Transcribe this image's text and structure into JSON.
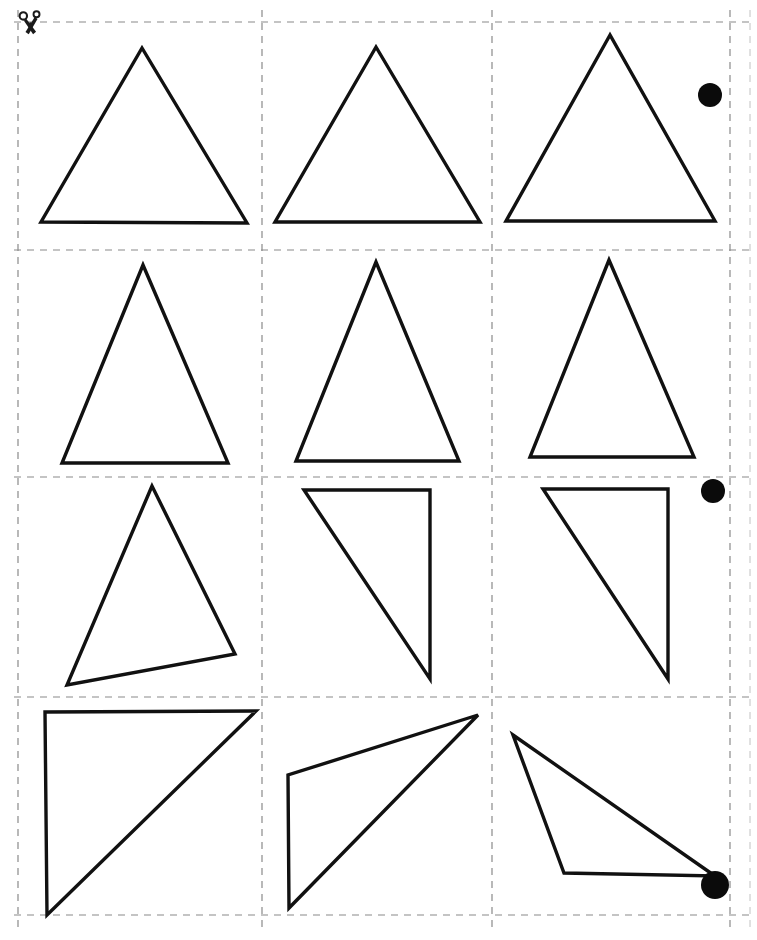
{
  "page": {
    "width": 757,
    "height": 940,
    "background_color": "#ffffff",
    "ink_color": "#111111",
    "cut_line_color": "#8a8a8a",
    "marker_color": "#0b0b0b"
  },
  "cut_guide": {
    "name": "dashed-cut-grid",
    "columns": 3,
    "rows": 4,
    "vertical_lines_x": [
      18,
      262,
      492,
      730,
      750
    ],
    "horizontal_lines_y": [
      22,
      250,
      477,
      697,
      915
    ],
    "dash_pattern": "7 6",
    "stroke_width": 1.2
  },
  "scissors": {
    "label": "cut-here-scissors",
    "x": 22,
    "y": 12
  },
  "markers": [
    {
      "label": "corner-dot-row1",
      "cx": 710,
      "cy": 95,
      "r": 12
    },
    {
      "label": "corner-dot-row3",
      "cx": 713,
      "cy": 491,
      "r": 12
    },
    {
      "label": "corner-dot-row4",
      "cx": 715,
      "cy": 885,
      "r": 14
    }
  ],
  "cells": [
    {
      "id": 1,
      "row": 1,
      "column": 1,
      "shape": "equilateral-triangle-upright",
      "orientation": "0deg",
      "bounds": {
        "x": 18,
        "y": 22,
        "w": 244,
        "h": 228
      },
      "points": "142,48 41,222 247,223",
      "has_marker": false
    },
    {
      "id": 2,
      "row": 1,
      "column": 2,
      "shape": "equilateral-triangle-upright",
      "orientation": "0deg",
      "bounds": {
        "x": 262,
        "y": 22,
        "w": 230,
        "h": 228
      },
      "points": "376,47 275,222 480,222",
      "has_marker": false
    },
    {
      "id": 3,
      "row": 1,
      "column": 3,
      "shape": "equilateral-triangle-upright",
      "orientation": "0deg",
      "bounds": {
        "x": 492,
        "y": 22,
        "w": 238,
        "h": 228
      },
      "points": "610,35 506,221 715,221",
      "has_marker": true
    },
    {
      "id": 4,
      "row": 2,
      "column": 1,
      "shape": "isosceles-triangle-tall",
      "orientation": "0deg",
      "bounds": {
        "x": 18,
        "y": 250,
        "w": 244,
        "h": 227
      },
      "points": "143,265 62,463 228,463",
      "has_marker": false
    },
    {
      "id": 5,
      "row": 2,
      "column": 2,
      "shape": "isosceles-triangle-tall",
      "orientation": "0deg",
      "bounds": {
        "x": 262,
        "y": 250,
        "w": 230,
        "h": 227
      },
      "points": "376,262 296,461 459,461",
      "has_marker": false
    },
    {
      "id": 6,
      "row": 2,
      "column": 3,
      "shape": "isosceles-triangle-tall",
      "orientation": "0deg",
      "bounds": {
        "x": 492,
        "y": 250,
        "w": 238,
        "h": 227
      },
      "points": "609,260 530,457 694,457",
      "has_marker": false
    },
    {
      "id": 7,
      "row": 3,
      "column": 1,
      "shape": "scalene-triangle-tilted",
      "orientation": "-10deg",
      "bounds": {
        "x": 18,
        "y": 477,
        "w": 244,
        "h": 220
      },
      "points": "152,486 67,685 235,654",
      "has_marker": false
    },
    {
      "id": 8,
      "row": 3,
      "column": 2,
      "shape": "right-triangle-rotated",
      "orientation": "90deg",
      "bounds": {
        "x": 262,
        "y": 477,
        "w": 230,
        "h": 220
      },
      "points": "304,490 430,490 430,679",
      "has_marker": false
    },
    {
      "id": 9,
      "row": 3,
      "column": 3,
      "shape": "right-triangle-rotated",
      "orientation": "90deg",
      "bounds": {
        "x": 492,
        "y": 477,
        "w": 238,
        "h": 220
      },
      "points": "543,489 668,489 668,679",
      "has_marker": true
    },
    {
      "id": 10,
      "row": 4,
      "column": 1,
      "shape": "right-triangle-isosceles",
      "orientation": "0deg",
      "bounds": {
        "x": 18,
        "y": 697,
        "w": 244,
        "h": 218
      },
      "points": "45,712 256,711 47,915",
      "has_marker": false
    },
    {
      "id": 11,
      "row": 4,
      "column": 2,
      "shape": "scalene-triangle-obtuse",
      "orientation": "-35deg",
      "bounds": {
        "x": 262,
        "y": 697,
        "w": 230,
        "h": 218
      },
      "points": "478,715 288,775 289,908",
      "has_marker": false
    },
    {
      "id": 12,
      "row": 4,
      "column": 3,
      "shape": "scalene-triangle-obtuse",
      "orientation": "-60deg",
      "bounds": {
        "x": 492,
        "y": 697,
        "w": 238,
        "h": 218
      },
      "points": "513,735 715,876 564,873",
      "has_marker": true
    }
  ]
}
